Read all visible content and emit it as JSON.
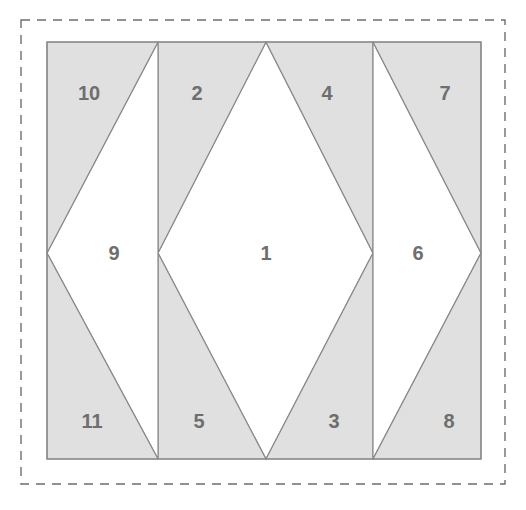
{
  "figure": {
    "title": "",
    "canvas": {
      "width": 526,
      "height": 510,
      "background": "#ffffff"
    },
    "colors": {
      "shaded_fill": "#e0e0e0",
      "unshaded_fill": "#ffffff",
      "stroke": "#8a8a8a",
      "dashed_border": "#6e6e6e",
      "label_text": "#6e6e6e"
    },
    "dashed_frame": {
      "x": 21,
      "y": 20,
      "width": 484,
      "height": 464,
      "dash": "9 7"
    },
    "plate": {
      "x": 47,
      "y": 42,
      "width": 434,
      "height": 417
    },
    "guides": {
      "mid_y": 253,
      "divider_x": [
        158,
        373
      ],
      "apex_top_x": [
        158,
        266,
        373
      ],
      "apex_bottom_x": [
        158,
        266,
        373
      ]
    },
    "regions": [
      {
        "id": 1,
        "label": "1",
        "shade": "unshaded",
        "points": "158,253 266,42 373,253 266,459",
        "label_x": 266,
        "label_y": 253
      },
      {
        "id": 2,
        "label": "2",
        "shade": "shaded",
        "points": "158,42 266,42 158,253",
        "label_x": 197,
        "label_y": 93
      },
      {
        "id": 3,
        "label": "3",
        "shade": "shaded",
        "points": "266,459 373,253 373,459",
        "label_x": 334,
        "label_y": 421
      },
      {
        "id": 4,
        "label": "4",
        "shade": "shaded",
        "points": "266,42 373,42 373,253",
        "label_x": 327,
        "label_y": 93
      },
      {
        "id": 5,
        "label": "5",
        "shade": "shaded",
        "points": "158,253 266,459 158,459",
        "label_x": 199,
        "label_y": 421
      },
      {
        "id": 6,
        "label": "6",
        "shade": "unshaded",
        "points": "373,42 481,253 373,459",
        "label_x": 418,
        "label_y": 253
      },
      {
        "id": 7,
        "label": "7",
        "shade": "shaded",
        "points": "373,42 481,42 481,253",
        "label_x": 445,
        "label_y": 93
      },
      {
        "id": 8,
        "label": "8",
        "shade": "shaded",
        "points": "481,253 481,459 373,459",
        "label_x": 449,
        "label_y": 421
      },
      {
        "id": 9,
        "label": "9",
        "shade": "unshaded",
        "points": "47,253 158,42 158,459",
        "label_x": 114,
        "label_y": 253
      },
      {
        "id": 10,
        "label": "10",
        "shade": "shaded",
        "points": "47,42 158,42 47,253",
        "label_x": 89,
        "label_y": 93
      },
      {
        "id": 11,
        "label": "11",
        "shade": "shaded",
        "points": "47,253 158,459 47,459",
        "label_x": 92,
        "label_y": 421
      }
    ]
  }
}
